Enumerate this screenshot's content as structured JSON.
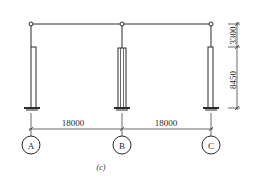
{
  "diagram": {
    "type": "structural-frame-elevation",
    "caption": "(c)",
    "colors": {
      "line": "#2a2a2a",
      "background": "#ffffff"
    },
    "axes": [
      {
        "label": "A"
      },
      {
        "label": "B"
      },
      {
        "label": "C"
      }
    ],
    "spans": [
      {
        "label": "18000"
      },
      {
        "label": "18000"
      }
    ],
    "heights": [
      {
        "label": "3300"
      },
      {
        "label": "8450"
      }
    ]
  }
}
